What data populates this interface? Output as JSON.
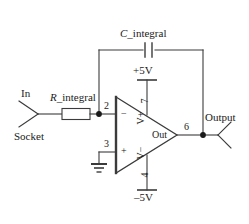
{
  "diagram": {
    "line_color": "#3b3b3b",
    "text_color": "#1a1a1a"
  },
  "input": {
    "label_top": "In",
    "label_bottom": "Socket"
  },
  "resistor": {
    "symbol_prefix": "R",
    "symbol_suffix": "_integral",
    "label": "R_integral"
  },
  "capacitor": {
    "symbol_prefix": "C",
    "symbol_suffix": "_integral",
    "label": "C_integral"
  },
  "supply": {
    "positive": "+5V",
    "negative": "–5V"
  },
  "opamp": {
    "inverting_sign": "−",
    "noninverting_sign": "+",
    "vplus_label": "V+",
    "vminus_label": "V−",
    "out_label": "Out",
    "pins": {
      "inverting": "2",
      "noninverting": "3",
      "vpos": "7",
      "vneg": "4",
      "output": "6"
    }
  },
  "output": {
    "label": "Output"
  }
}
